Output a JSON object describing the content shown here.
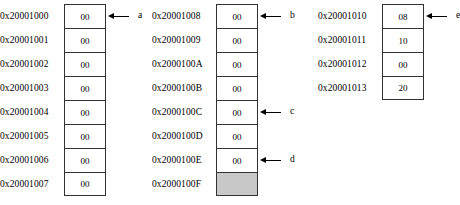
{
  "diagram": {
    "type": "memory-map",
    "cell_width_note": "byte cell",
    "colors": {
      "cell_border": "#333333",
      "cell_background": "#ffffff",
      "shaded_cell_background": "#c8c8c8",
      "text": "#000000",
      "arrow": "#000000",
      "page_background": "#ffffff"
    },
    "columns": [
      {
        "id": "column-1",
        "rows": [
          {
            "address": "0x20001000",
            "value": "00",
            "shaded": false,
            "pointer": "a"
          },
          {
            "address": "0x20001001",
            "value": "00",
            "shaded": false,
            "pointer": ""
          },
          {
            "address": "0x20001002",
            "value": "00",
            "shaded": false,
            "pointer": ""
          },
          {
            "address": "0x20001003",
            "value": "00",
            "shaded": false,
            "pointer": ""
          },
          {
            "address": "0x20001004",
            "value": "00",
            "shaded": false,
            "pointer": ""
          },
          {
            "address": "0x20001005",
            "value": "00",
            "shaded": false,
            "pointer": ""
          },
          {
            "address": "0x20001006",
            "value": "00",
            "shaded": false,
            "pointer": ""
          },
          {
            "address": "0x20001007",
            "value": "00",
            "shaded": false,
            "pointer": ""
          }
        ]
      },
      {
        "id": "column-2",
        "rows": [
          {
            "address": "0x20001008",
            "value": "00",
            "shaded": false,
            "pointer": "b"
          },
          {
            "address": "0x20001009",
            "value": "00",
            "shaded": false,
            "pointer": ""
          },
          {
            "address": "0x2000100A",
            "value": "00",
            "shaded": false,
            "pointer": ""
          },
          {
            "address": "0x2000100B",
            "value": "00",
            "shaded": false,
            "pointer": ""
          },
          {
            "address": "0x2000100C",
            "value": "00",
            "shaded": false,
            "pointer": "c"
          },
          {
            "address": "0x2000100D",
            "value": "00",
            "shaded": false,
            "pointer": ""
          },
          {
            "address": "0x2000100E",
            "value": "00",
            "shaded": false,
            "pointer": "d"
          },
          {
            "address": "0x2000100F",
            "value": "",
            "shaded": true,
            "pointer": ""
          }
        ]
      },
      {
        "id": "column-3",
        "rows": [
          {
            "address": "0x20001010",
            "value": "08",
            "shaded": false,
            "pointer": "e"
          },
          {
            "address": "0x20001011",
            "value": "10",
            "shaded": false,
            "pointer": ""
          },
          {
            "address": "0x20001012",
            "value": "00",
            "shaded": false,
            "pointer": ""
          },
          {
            "address": "0x20001013",
            "value": "20",
            "shaded": false,
            "pointer": ""
          }
        ]
      }
    ]
  }
}
